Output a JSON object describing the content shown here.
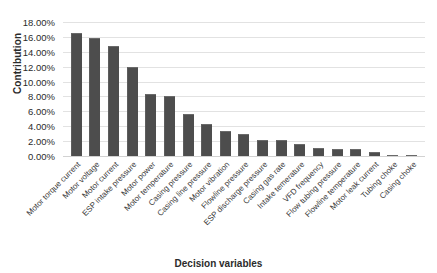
{
  "chart_data": {
    "type": "bar",
    "title": "",
    "xlabel": "Decision variables",
    "ylabel": "Contribution",
    "ylim": [
      0,
      18
    ],
    "yticks": [
      "0.00%",
      "2.00%",
      "4.00%",
      "6.00%",
      "8.00%",
      "10.00%",
      "12.00%",
      "14.00%",
      "16.00%",
      "18.00%"
    ],
    "ytick_values": [
      0,
      2,
      4,
      6,
      8,
      10,
      12,
      14,
      16,
      18
    ],
    "grid": true,
    "legend": "none",
    "bar_color": "#4d4d4d",
    "gridline_color": "#e2e2e2",
    "unit": "%",
    "categories": [
      "Motor torque current",
      "Motor voltage",
      "Motor current",
      "ESP intake pressure",
      "Motor power",
      "Motor temperature",
      "Casing pressure",
      "Casing line pressure",
      "Motor vibration",
      "Flowline pressure",
      "ESP discharge pressure",
      "Casing gas rate",
      "Intake temerature",
      "VFD frequency",
      "Flow tubing pressure",
      "Flowline temperature",
      "Motor leak current",
      "Tubing choke",
      "Casing choke"
    ],
    "values": [
      16.5,
      15.9,
      14.8,
      12.0,
      8.3,
      8.1,
      5.7,
      4.3,
      3.3,
      2.9,
      2.2,
      2.1,
      1.6,
      1.1,
      1.0,
      0.9,
      0.6,
      0.15,
      0.12
    ]
  }
}
